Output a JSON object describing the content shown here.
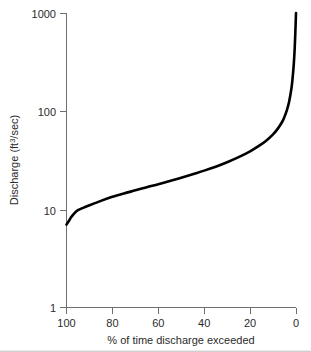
{
  "chart_data": {
    "type": "line",
    "title": "",
    "subtitle": "",
    "xlabel": "% of time discharge exceeded",
    "ylabel": "Discharge (ft3/sec)",
    "ylabel_base": "Discharge  (ft",
    "ylabel_superscript": "3",
    "ylabel_tail": "/sec)",
    "yscale": "log",
    "xscale": "linear",
    "x_reversed": true,
    "xlim": [
      100,
      0
    ],
    "ylim": [
      1,
      1000
    ],
    "grid": false,
    "legend": null,
    "xticks": [
      100,
      80,
      60,
      40,
      20,
      0
    ],
    "xtick_labels": [
      "100",
      "80",
      "60",
      "40",
      "20",
      "0"
    ],
    "yticks": [
      1,
      10,
      100,
      1000
    ],
    "ytick_labels": [
      "1",
      "10",
      "100",
      "1000"
    ],
    "series": [
      {
        "name": "Flow duration curve",
        "color": "#000000",
        "x": [
          100,
          99,
          98,
          97,
          96,
          95,
          93,
          90,
          85,
          80,
          75,
          70,
          65,
          60,
          55,
          50,
          45,
          40,
          35,
          30,
          25,
          20,
          16,
          13,
          10,
          8,
          6,
          5,
          4,
          3,
          2,
          1.5,
          1,
          0.6,
          0.3,
          0
        ],
        "y": [
          7.0,
          7.6,
          8.3,
          8.9,
          9.4,
          9.8,
          10.3,
          11.0,
          12.2,
          13.4,
          14.5,
          15.6,
          16.8,
          18.0,
          19.4,
          21.0,
          22.8,
          24.8,
          27.2,
          30.2,
          34.0,
          39.0,
          44.5,
          50.0,
          58.0,
          66.0,
          78.0,
          88.0,
          102.0,
          125.0,
          170.0,
          215.0,
          295.0,
          420.0,
          620.0,
          1000.0
        ]
      }
    ],
    "annotations": []
  },
  "axes": {
    "y_axis_name": "discharge-log-axis",
    "x_axis_name": "percent-exceedance-axis"
  }
}
